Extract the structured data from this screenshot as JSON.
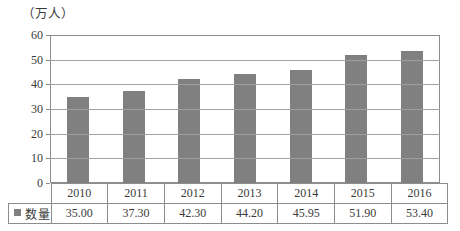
{
  "chart_data": {
    "type": "bar",
    "title": "",
    "subtitle": "",
    "unit_label": "（万人）",
    "xlabel": "",
    "ylabel": "",
    "categories": [
      "2010",
      "2011",
      "2012",
      "2013",
      "2014",
      "2015",
      "2016"
    ],
    "values": [
      35.0,
      37.3,
      42.3,
      44.2,
      45.95,
      51.9,
      53.4
    ],
    "value_labels": [
      "35.00",
      "37.30",
      "42.30",
      "44.20",
      "45.95",
      "51.90",
      "53.40"
    ],
    "series": [
      {
        "name": "数量",
        "values": [
          35.0,
          37.3,
          42.3,
          44.2,
          45.95,
          51.9,
          53.4
        ],
        "color": "#808080"
      }
    ],
    "ylim": [
      0,
      60
    ],
    "ytick_values": [
      0,
      10,
      20,
      30,
      40,
      50,
      60
    ],
    "ytick_labels": [
      "0",
      "10",
      "20",
      "30",
      "40",
      "50",
      "60"
    ],
    "grid": true,
    "grid_axis": "y",
    "legend_position": "table-row-header",
    "legend_entries": [
      "数量"
    ],
    "bar_color": "#808080",
    "grid_color": "#a0a0a0",
    "axis_color": "#8d8d8d"
  },
  "table": {
    "legend_label": "数量",
    "header_row": [
      "2010",
      "2011",
      "2012",
      "2013",
      "2014",
      "2015",
      "2016"
    ],
    "value_row": [
      "35.00",
      "37.30",
      "42.30",
      "44.20",
      "45.95",
      "51.90",
      "53.40"
    ]
  }
}
